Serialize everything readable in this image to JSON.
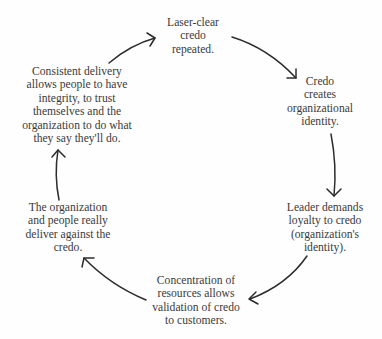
{
  "diagram": {
    "type": "cycle",
    "direction": "clockwise",
    "nodes": [
      {
        "id": "credo",
        "lines": [
          "Laser-clear",
          "credo",
          "repeated."
        ]
      },
      {
        "id": "identity",
        "lines": [
          "Credo",
          "creates",
          "organizational",
          "identity."
        ]
      },
      {
        "id": "loyalty",
        "lines": [
          "Leader demands",
          "loyalty to credo",
          "(organization's",
          "identity)."
        ]
      },
      {
        "id": "resources",
        "lines": [
          "Concentration of",
          "resources allows",
          "validation of credo",
          "to customers."
        ]
      },
      {
        "id": "deliver",
        "lines": [
          "The organization",
          "and people really",
          "deliver against the",
          "credo."
        ]
      },
      {
        "id": "integrity",
        "lines": [
          "Consistent delivery",
          "allows people to have",
          "integrity, to trust",
          "themselves and the",
          "organization to do what",
          "they say they'll do."
        ]
      }
    ],
    "edges": [
      {
        "from": "integrity",
        "to": "credo"
      },
      {
        "from": "credo",
        "to": "identity"
      },
      {
        "from": "identity",
        "to": "loyalty"
      },
      {
        "from": "loyalty",
        "to": "resources"
      },
      {
        "from": "resources",
        "to": "deliver"
      },
      {
        "from": "deliver",
        "to": "integrity"
      }
    ],
    "colors": {
      "text": "#3a3a3a",
      "arrow": "#2c2c2c",
      "background": "#fefefe"
    }
  }
}
